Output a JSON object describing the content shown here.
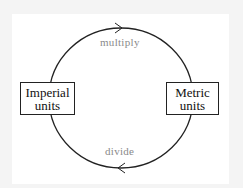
{
  "diagram": {
    "nodes": [
      {
        "id": "imperial",
        "line1": "Imperial",
        "line2": "units"
      },
      {
        "id": "metric",
        "line1": "Metric",
        "line2": "units"
      }
    ],
    "edges": [
      {
        "from": "imperial",
        "to": "metric",
        "label": "multiply",
        "direction": "clockwise-top"
      },
      {
        "from": "metric",
        "to": "imperial",
        "label": "divide",
        "direction": "clockwise-bottom"
      }
    ],
    "colors": {
      "background": "#f4f4f4",
      "card": "#ffffff",
      "stroke": "#222222",
      "edge_label": "#8a8a8a"
    }
  }
}
